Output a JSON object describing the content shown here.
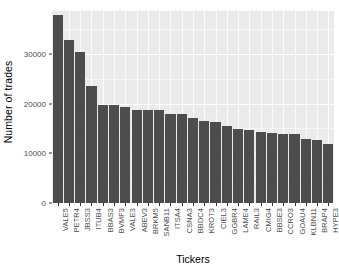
{
  "chart_data": {
    "type": "bar",
    "title": "",
    "subtitle": "",
    "xlabel": "Tickers",
    "ylabel": "Number of trades",
    "categories": [
      "VALE5",
      "PETR4",
      "JBSS3",
      "ITUB4",
      "BBAS3",
      "BVMF3",
      "VALE3",
      "ABEV3",
      "BRKM5",
      "SANB11",
      "ITSA4",
      "CSNA3",
      "BBDC4",
      "KROT3",
      "CIEL3",
      "GGBR4",
      "LAME4",
      "RAIL3",
      "CMIG4",
      "BBSE3",
      "CCRO3",
      "GOAU4",
      "KLBN11",
      "BRAP4",
      "HYPE3"
    ],
    "values": [
      37800,
      32700,
      30400,
      23500,
      19700,
      19800,
      19300,
      18800,
      18700,
      18700,
      17800,
      17800,
      17100,
      16500,
      16200,
      15400,
      14900,
      14700,
      14300,
      14000,
      13800,
      13800,
      12800,
      12700,
      11800
    ],
    "ylim": [
      0,
      38600
    ],
    "yticks": [
      0,
      10000,
      20000,
      30000
    ],
    "ytick_labels": [
      "0",
      "10000",
      "20000",
      "30000"
    ],
    "yminor_ticks": [
      5000,
      15000,
      25000,
      35000
    ],
    "grid": true,
    "legend": "none",
    "bar_color": "#4d4d4d",
    "panel_color": "#ebebeb",
    "gridline_color": "#ffffff",
    "axis_text_color": "#4d4d4d",
    "xtick_label_rotation": 90
  }
}
